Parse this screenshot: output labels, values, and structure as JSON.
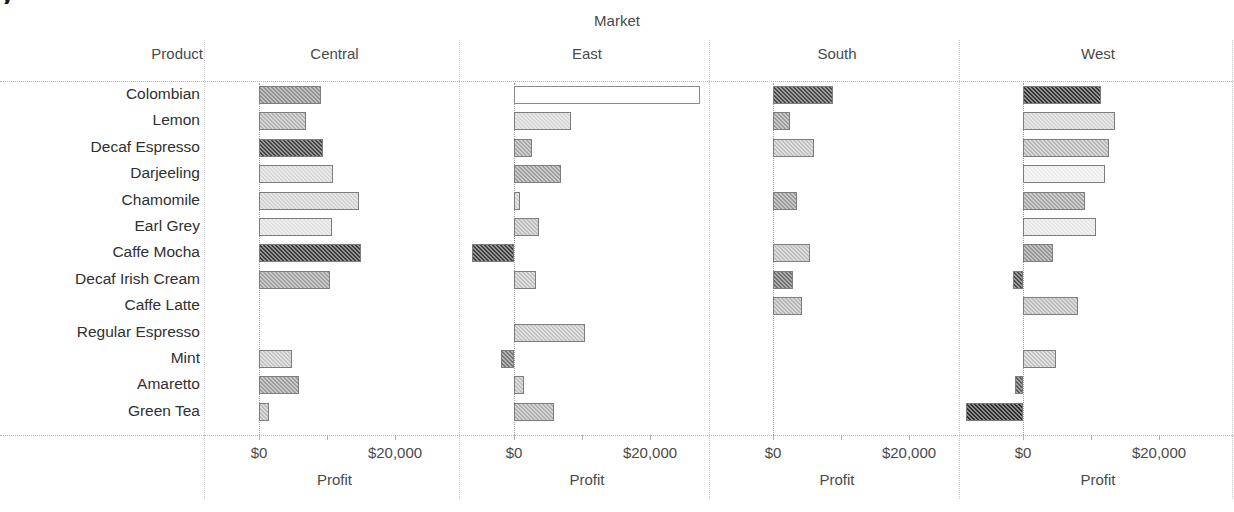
{
  "title_sliver": "y",
  "header": {
    "group_label": "Market",
    "product_header": "Product",
    "panels": [
      "Central",
      "East",
      "South",
      "West"
    ]
  },
  "axis": {
    "title": "Profit",
    "tick_labels": [
      "$0",
      "$20,000"
    ],
    "tick_values": [
      0,
      10000,
      20000
    ],
    "xmin": -10000,
    "xmax": 30000
  },
  "chart_data": {
    "type": "bar",
    "orientation": "horizontal",
    "small_multiples": true,
    "facet_field": "Market",
    "xlabel": "Profit",
    "ylabel": "Product",
    "grid": false,
    "legend": "none",
    "categories": [
      "Colombian",
      "Lemon",
      "Decaf Espresso",
      "Darjeeling",
      "Chamomile",
      "Earl Grey",
      "Caffe Mocha",
      "Decaf Irish Cream",
      "Caffe Latte",
      "Regular Espresso",
      "Mint",
      "Amaretto",
      "Green Tea"
    ],
    "series": [
      {
        "name": "Central",
        "values": [
          9100,
          6900,
          9400,
          10900,
          14700,
          10700,
          15000,
          10400,
          0,
          0,
          4800,
          5900,
          1500
        ],
        "shades": [
          "#8f8f8f",
          "#b4b4b4",
          "#444444",
          "#d8d8d8",
          "#d2d2d2",
          "#e0e0e0",
          "#3b3b3b",
          "#a0a0a0",
          null,
          null,
          "#c6c6c6",
          "#9c9c9c",
          "#bcbcbc"
        ]
      },
      {
        "name": "East",
        "values": [
          27400,
          8400,
          2700,
          6900,
          900,
          3700,
          -6200,
          3200,
          0,
          10500,
          -1900,
          1500,
          5900
        ],
        "shades": [
          "#ffffff",
          "#d6d6d6",
          "#a8a8a8",
          "#9e9e9e",
          "#cfcfcf",
          "#bdbdbd",
          "#3f3f3f",
          "#c2c2c2",
          null,
          "#c4c4c4",
          "#777777",
          "#c0c0c0",
          "#b0b0b0"
        ]
      },
      {
        "name": "South",
        "values": [
          8800,
          2500,
          6000,
          0,
          3500,
          0,
          5400,
          2900,
          4300,
          0,
          0,
          0,
          0
        ],
        "shades": [
          "#4a4a4a",
          "#9c9c9c",
          "#c2c2c2",
          null,
          "#9a9a9a",
          null,
          "#bfbfbf",
          "#6e6e6e",
          "#b6b6b6",
          null,
          null,
          null,
          null
        ]
      },
      {
        "name": "West",
        "values": [
          11400,
          13600,
          12600,
          12000,
          9100,
          10700,
          4400,
          -1500,
          8100,
          0,
          4800,
          -1200,
          -8400
        ],
        "shades": [
          "#353535",
          "#d4d4d4",
          "#b8b8b8",
          "#ececec",
          "#a6a6a6",
          "#e6e6e6",
          "#949494",
          "#4c4c4c",
          "#bcbcbc",
          null,
          "#c4c4c4",
          "#5a5a5a",
          "#2e2e2e"
        ]
      }
    ]
  }
}
